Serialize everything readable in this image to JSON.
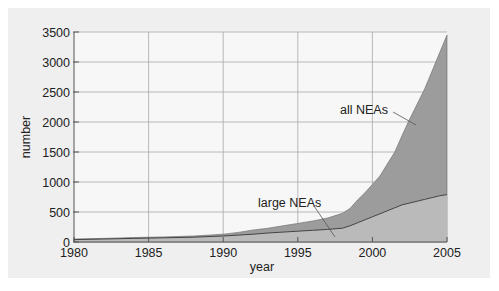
{
  "chart_data": {
    "type": "area",
    "title": "",
    "xlabel": "year",
    "ylabel": "number",
    "xlim": [
      1980,
      2005
    ],
    "ylim": [
      0,
      3500
    ],
    "grid": true,
    "x_ticks": [
      "1980",
      "1985",
      "1990",
      "1995",
      "2000",
      "2005"
    ],
    "y_ticks": [
      "0",
      "500",
      "1000",
      "1500",
      "2000",
      "2500",
      "3000",
      "3500"
    ],
    "x": [
      1980,
      1982,
      1984,
      1986,
      1988,
      1990,
      1991,
      1992,
      1993,
      1994,
      1995,
      1996,
      1997,
      1998,
      1998.5,
      1999,
      1999.5,
      2000,
      2000.5,
      2001,
      2001.5,
      2002,
      2002.5,
      2003,
      2003.5,
      2004,
      2004.5,
      2005
    ],
    "series": [
      {
        "name": "all NEAs",
        "values": [
          50,
          60,
          75,
          85,
          100,
          130,
          160,
          200,
          230,
          270,
          310,
          350,
          400,
          480,
          560,
          700,
          820,
          960,
          1100,
          1300,
          1500,
          1780,
          2050,
          2300,
          2550,
          2850,
          3150,
          3450
        ],
        "color": "#9c9c9c"
      },
      {
        "name": "large NEAs",
        "values": [
          40,
          50,
          60,
          70,
          80,
          100,
          115,
          130,
          150,
          165,
          180,
          195,
          210,
          230,
          270,
          320,
          370,
          420,
          470,
          520,
          570,
          620,
          650,
          680,
          710,
          740,
          770,
          790
        ],
        "color": "#bababa",
        "line_color": "#444444"
      }
    ],
    "annotations": [
      {
        "text": "all NEAs",
        "pointer_to": [
          2004,
          2400
        ]
      },
      {
        "text": "large NEAs",
        "pointer_to": [
          1998,
          100
        ]
      }
    ],
    "legend": "none (inline annotations)"
  },
  "labels": {
    "xlabel": "year",
    "ylabel": "number",
    "all": "all NEAs",
    "large": "large NEAs"
  }
}
